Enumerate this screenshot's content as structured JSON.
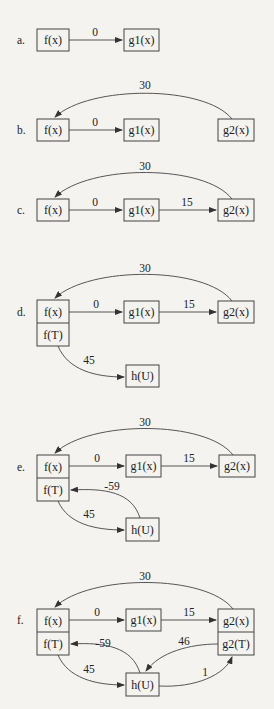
{
  "diagrams": [
    {
      "label": "a.",
      "nodes": {
        "f": "f(x)",
        "g1": "g1(x)"
      },
      "edges": [
        {
          "from": "f(x)",
          "to": "g1(x)",
          "weight": "0"
        }
      ]
    },
    {
      "label": "b.",
      "nodes": {
        "f": "f(x)",
        "g1": "g1(x)",
        "g2": "g2(x)"
      },
      "edges": [
        {
          "from": "f(x)",
          "to": "g1(x)",
          "weight": "0"
        },
        {
          "from": "g2(x)",
          "to": "f(x)",
          "weight": "30"
        }
      ]
    },
    {
      "label": "c.",
      "nodes": {
        "f": "f(x)",
        "g1": "g1(x)",
        "g2": "g2(x)"
      },
      "edges": [
        {
          "from": "f(x)",
          "to": "g1(x)",
          "weight": "0"
        },
        {
          "from": "g1(x)",
          "to": "g2(x)",
          "weight": "15"
        },
        {
          "from": "g2(x)",
          "to": "f(x)",
          "weight": "30"
        }
      ]
    },
    {
      "label": "d.",
      "nodes": {
        "f": "f(x)",
        "fT": "f(T)",
        "g1": "g1(x)",
        "g2": "g2(x)",
        "h": "h(U)"
      },
      "edges": [
        {
          "from": "f(x)",
          "to": "g1(x)",
          "weight": "0"
        },
        {
          "from": "g1(x)",
          "to": "g2(x)",
          "weight": "15"
        },
        {
          "from": "g2(x)",
          "to": "f(x)",
          "weight": "30"
        },
        {
          "from": "f(T)",
          "to": "h(U)",
          "weight": "45"
        }
      ]
    },
    {
      "label": "e.",
      "nodes": {
        "f": "f(x)",
        "fT": "f(T)",
        "g1": "g1(x)",
        "g2": "g2(x)",
        "h": "h(U)"
      },
      "edges": [
        {
          "from": "f(x)",
          "to": "g1(x)",
          "weight": "0"
        },
        {
          "from": "g1(x)",
          "to": "g2(x)",
          "weight": "15"
        },
        {
          "from": "g2(x)",
          "to": "f(x)",
          "weight": "30"
        },
        {
          "from": "f(T)",
          "to": "h(U)",
          "weight": "45"
        },
        {
          "from": "h(U)",
          "to": "f(T)",
          "weight": "-59"
        }
      ]
    },
    {
      "label": "f.",
      "nodes": {
        "f": "f(x)",
        "fT": "f(T)",
        "g1": "g1(x)",
        "g2": "g2(x)",
        "g2T": "g2(T)",
        "h": "h(U)"
      },
      "edges": [
        {
          "from": "f(x)",
          "to": "g1(x)",
          "weight": "0"
        },
        {
          "from": "g1(x)",
          "to": "g2(x)",
          "weight": "15"
        },
        {
          "from": "g2(x)",
          "to": "f(x)",
          "weight": "30"
        },
        {
          "from": "f(T)",
          "to": "h(U)",
          "weight": "45"
        },
        {
          "from": "h(U)",
          "to": "f(T)",
          "weight": "-59"
        },
        {
          "from": "g2(T)",
          "to": "h(U)",
          "weight": "46"
        },
        {
          "from": "h(U)",
          "to": "g2(T)",
          "weight": "1"
        }
      ]
    }
  ]
}
